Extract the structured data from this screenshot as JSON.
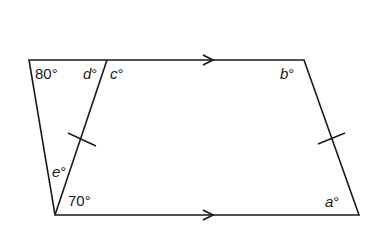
{
  "diagram": {
    "type": "trapezium with diagonal",
    "colors": {
      "stroke": "#1a1a1a",
      "background": "#ffffff"
    },
    "vertices": {
      "top_left": [
        29,
        60
      ],
      "diagonal_top": [
        107,
        60
      ],
      "top_right": [
        304,
        60
      ],
      "bottom_left": [
        55,
        215
      ],
      "bottom_right": [
        359,
        215
      ]
    },
    "labels": {
      "angle_80": "80°",
      "angle_d": "d°",
      "angle_c": "c°",
      "angle_b": "b°",
      "angle_e": "e°",
      "angle_70": "70°",
      "angle_a": "a°"
    },
    "markers": {
      "parallel_arrows": 2,
      "equal_length_ticks": 2
    }
  }
}
